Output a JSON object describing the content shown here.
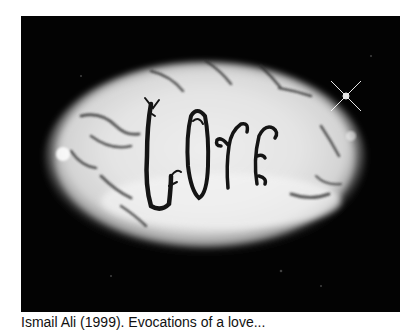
{
  "figure": {
    "depicted_word": "Love",
    "caption": "Ismail Ali (1999). Evocations of a love...",
    "colors": {
      "frame": "#030303",
      "oval_light": "#f2f2f2",
      "oval_mid": "#bdbdbd",
      "twig": "#1a1a1a",
      "page_bg": "#ffffff"
    }
  }
}
